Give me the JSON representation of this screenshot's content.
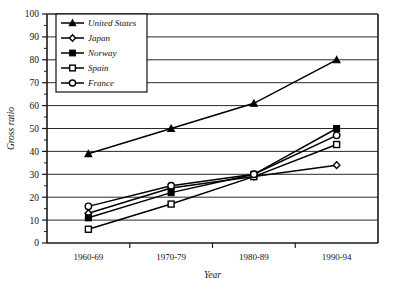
{
  "chart_data": {
    "type": "line",
    "title": "",
    "xlabel": "Year",
    "ylabel": "Gross ratio",
    "categories": [
      "1960-69",
      "1970-79",
      "1980-89",
      "1990-94"
    ],
    "ylim": [
      0,
      100
    ],
    "ytick_step": 10,
    "yticks": [
      0,
      10,
      20,
      30,
      40,
      50,
      60,
      70,
      80,
      90,
      100
    ],
    "minor_tick_step": 5,
    "grid": "horizontal",
    "legend_position": "top-left-inside",
    "series": [
      {
        "name": "United States",
        "marker": "filled-triangle",
        "values": [
          39,
          50,
          61,
          80
        ]
      },
      {
        "name": "Japan",
        "marker": "open-diamond",
        "values": [
          13,
          24,
          29,
          34
        ]
      },
      {
        "name": "Norway",
        "marker": "filled-square",
        "values": [
          11,
          22,
          30,
          50
        ]
      },
      {
        "name": "Spain",
        "marker": "open-square",
        "values": [
          6,
          17,
          29,
          43
        ]
      },
      {
        "name": "France",
        "marker": "open-circle",
        "values": [
          16,
          25,
          30,
          47
        ]
      }
    ],
    "colors": {
      "line": "#000000",
      "grid": "#2a2a2a",
      "axis": "#1a1a1a",
      "background": "#ffffff"
    }
  }
}
